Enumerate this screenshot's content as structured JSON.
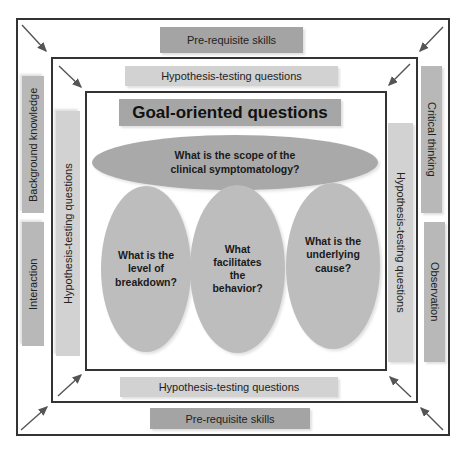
{
  "diagram": {
    "outer_layer": {
      "top_label": "Pre-requisite skills",
      "bottom_label": "Pre-requisite skills",
      "left_labels": [
        "Background knowledge",
        "Interaction"
      ],
      "right_labels": [
        "Critical thinking",
        "Observation"
      ]
    },
    "middle_layer": {
      "top_label": "Hypothesis-testing questions",
      "bottom_label": "Hypothesis-testing questions",
      "left_label": "Hypothesis-testing questions",
      "right_label": "Hypothesis-testing questions"
    },
    "inner_layer": {
      "title": "Goal-oriented questions",
      "scope_question": "What is the scope of the clinical symptomatology?",
      "questions": [
        "What is the level of breakdown?",
        "What facilitates the behavior?",
        "What is the underlying cause?"
      ]
    },
    "arrows": {
      "corners": [
        "top-left",
        "top-right",
        "bottom-left",
        "bottom-right"
      ],
      "direction": "inward",
      "color": "#555555"
    },
    "colors": {
      "frame": "#333333",
      "dark_label": "#a4a4a4",
      "mid_label": "#b8b8b8",
      "light_label": "#d2d2d2",
      "ellipse": "#bdbdbd"
    }
  }
}
